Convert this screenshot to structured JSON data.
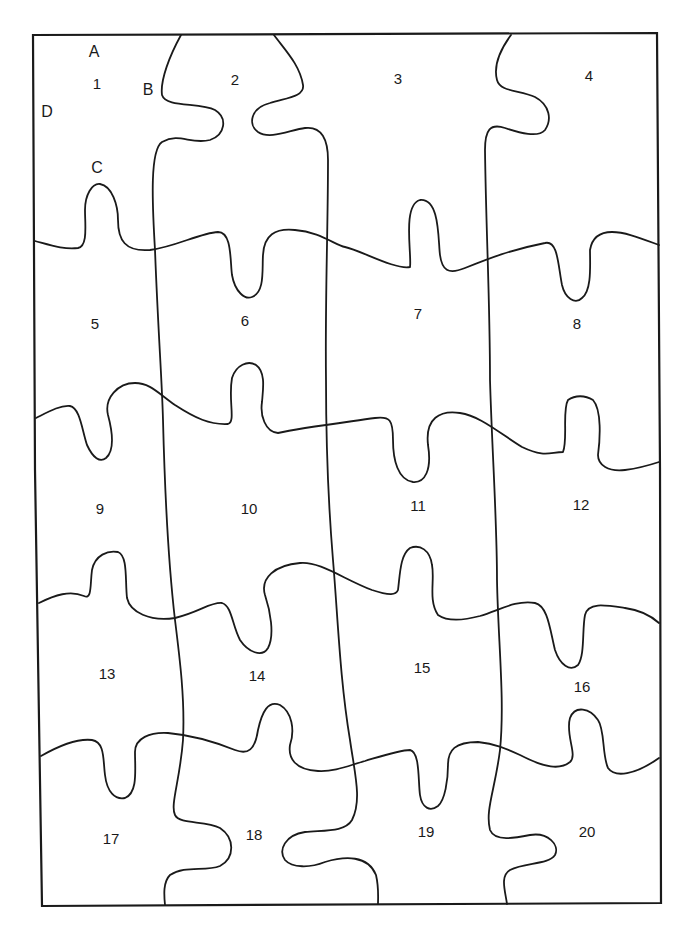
{
  "diagram": {
    "type": "jigsaw-puzzle-outline",
    "grid": {
      "rows": 5,
      "columns": 4
    },
    "pieces": [
      {
        "label": "1",
        "x": 97,
        "y": 83
      },
      {
        "label": "2",
        "x": 235,
        "y": 79
      },
      {
        "label": "3",
        "x": 398,
        "y": 78
      },
      {
        "label": "4",
        "x": 589,
        "y": 75
      },
      {
        "label": "5",
        "x": 95,
        "y": 323
      },
      {
        "label": "6",
        "x": 245,
        "y": 320
      },
      {
        "label": "7",
        "x": 418,
        "y": 313
      },
      {
        "label": "8",
        "x": 577,
        "y": 323
      },
      {
        "label": "9",
        "x": 100,
        "y": 508
      },
      {
        "label": "10",
        "x": 249,
        "y": 508
      },
      {
        "label": "11",
        "x": 418,
        "y": 505
      },
      {
        "label": "12",
        "x": 581,
        "y": 504
      },
      {
        "label": "13",
        "x": 107,
        "y": 673
      },
      {
        "label": "14",
        "x": 257,
        "y": 675
      },
      {
        "label": "15",
        "x": 422,
        "y": 667
      },
      {
        "label": "16",
        "x": 582,
        "y": 686
      },
      {
        "label": "17",
        "x": 111,
        "y": 838
      },
      {
        "label": "18",
        "x": 254,
        "y": 834
      },
      {
        "label": "19",
        "x": 426,
        "y": 831
      },
      {
        "label": "20",
        "x": 587,
        "y": 831
      }
    ],
    "side_labels": [
      {
        "label": "A",
        "x": 94,
        "y": 52
      },
      {
        "label": "B",
        "x": 148,
        "y": 90
      },
      {
        "label": "C",
        "x": 97,
        "y": 168
      },
      {
        "label": "D",
        "x": 47,
        "y": 112
      }
    ],
    "colors": {
      "line": "#1a1a1a",
      "background": "#ffffff"
    }
  }
}
